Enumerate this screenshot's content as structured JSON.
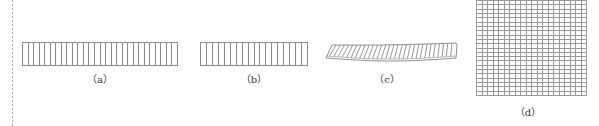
{
  "figure": {
    "panels": [
      {
        "id": "a",
        "label": "（a）",
        "description": "straight strip divided into vertical cells",
        "cell_count": 28
      },
      {
        "id": "b",
        "label": "（b）",
        "description": "shorter straight strip divided into vertical cells",
        "cell_count": 18
      },
      {
        "id": "c",
        "label": "（c）",
        "description": "deformed / bent strip with slanted hatching",
        "cell_count": 30
      },
      {
        "id": "d",
        "label": "（d）",
        "description": "square mesh grid",
        "grid_columns": 20,
        "grid_rows": 22
      }
    ],
    "colors": {
      "stroke": "#8a8a8a",
      "grid_stroke": "#9a9a9a",
      "divider": "#aaaaaa",
      "text": "#333333"
    }
  }
}
